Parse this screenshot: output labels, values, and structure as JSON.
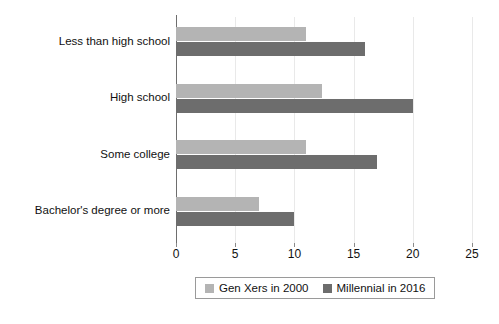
{
  "chart_data": {
    "type": "bar",
    "orientation": "horizontal",
    "title": "",
    "subtitle": "",
    "xlabel": "",
    "ylabel": "",
    "xlim": [
      0,
      25
    ],
    "xticks": [
      0,
      5,
      10,
      15,
      20,
      25
    ],
    "xtick_labels": [
      "0",
      "5",
      "10",
      "15",
      "20",
      "25"
    ],
    "grid": true,
    "grid_axis": "x",
    "legend_position": "bottom",
    "categories": [
      "Less than high school",
      "High school",
      "Some college",
      "Bachelor's degree or more"
    ],
    "series": [
      {
        "name": "Gen Xers in 2000",
        "color": "#b4b4b4",
        "values": [
          11,
          12.3,
          11,
          7
        ]
      },
      {
        "name": "Millennial in 2016",
        "color": "#6d6d6d",
        "values": [
          16,
          20,
          17,
          10
        ]
      }
    ]
  },
  "legend": {
    "items": [
      {
        "label": "Gen Xers in 2000",
        "color": "#b4b4b4",
        "swatch_name": "legend-swatch-gen-xers"
      },
      {
        "label": "Millennial in 2016",
        "color": "#6d6d6d",
        "swatch_name": "legend-swatch-millennial"
      }
    ]
  },
  "axis": {
    "axis_color": "#6e6e6e",
    "gridline_color": "#e9e9e9",
    "text_color": "#111111"
  },
  "background": "#ffffff"
}
